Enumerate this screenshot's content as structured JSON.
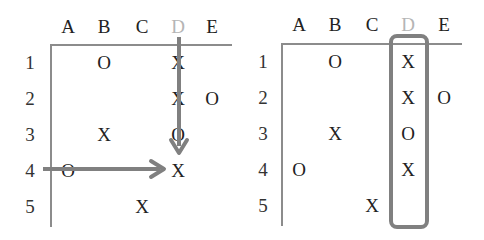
{
  "diagram": {
    "colors": {
      "text": "#222222",
      "dim_header": "#b5b5b5",
      "axis": "#8c8c8c",
      "highlight": "#808080"
    },
    "left": {
      "columns": [
        "A",
        "B",
        "C",
        "D",
        "E"
      ],
      "highlighted_column": "D",
      "rows": [
        "1",
        "2",
        "3",
        "4",
        "5"
      ],
      "cells": [
        {
          "row": "1",
          "col": "B",
          "value": "O"
        },
        {
          "row": "1",
          "col": "D",
          "value": "X"
        },
        {
          "row": "2",
          "col": "D",
          "value": "X"
        },
        {
          "row": "2",
          "col": "E",
          "value": "O"
        },
        {
          "row": "3",
          "col": "B",
          "value": "X"
        },
        {
          "row": "3",
          "col": "D",
          "value": "O"
        },
        {
          "row": "4",
          "col": "A",
          "value": "O"
        },
        {
          "row": "4",
          "col": "D",
          "value": "X"
        },
        {
          "row": "5",
          "col": "C",
          "value": "X"
        }
      ],
      "annotations": [
        {
          "type": "arrow",
          "direction": "down",
          "along": "column D",
          "from_row": "header",
          "to_row": "3"
        },
        {
          "type": "arrow",
          "direction": "right",
          "along": "row 4",
          "from_col": "axis",
          "to_col": "C"
        }
      ]
    },
    "right": {
      "columns": [
        "A",
        "B",
        "C",
        "D",
        "E"
      ],
      "highlighted_column": "D",
      "rows": [
        "1",
        "2",
        "3",
        "4",
        "5"
      ],
      "cells": [
        {
          "row": "1",
          "col": "B",
          "value": "O"
        },
        {
          "row": "1",
          "col": "D",
          "value": "X"
        },
        {
          "row": "2",
          "col": "D",
          "value": "X"
        },
        {
          "row": "2",
          "col": "E",
          "value": "O"
        },
        {
          "row": "3",
          "col": "B",
          "value": "X"
        },
        {
          "row": "3",
          "col": "D",
          "value": "O"
        },
        {
          "row": "4",
          "col": "A",
          "value": "O"
        },
        {
          "row": "4",
          "col": "D",
          "value": "X"
        },
        {
          "row": "5",
          "col": "C",
          "value": "X"
        }
      ],
      "annotations": [
        {
          "type": "rounded-box",
          "around": "column D",
          "rows": "1-5"
        }
      ]
    }
  }
}
